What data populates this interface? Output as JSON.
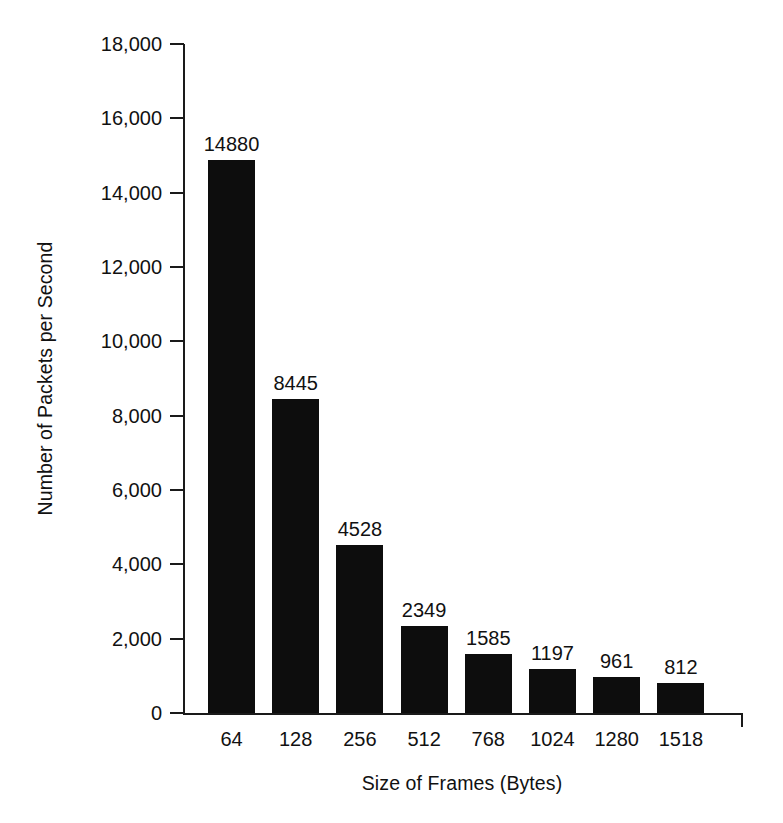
{
  "chart_data": {
    "type": "bar",
    "title": "",
    "subtitle": "",
    "xlabel": "Size of Frames (Bytes)",
    "ylabel": "Number of Packets per Second",
    "categories": [
      "64",
      "128",
      "256",
      "512",
      "768",
      "1024",
      "1280",
      "1518"
    ],
    "values": [
      14880,
      8445,
      4528,
      2349,
      1585,
      1197,
      961,
      812
    ],
    "value_labels": [
      "14880",
      "8445",
      "4528",
      "2349",
      "1585",
      "1197",
      "961",
      "812"
    ],
    "ylim": [
      0,
      18000
    ],
    "ytick_values": [
      18000,
      16000,
      14000,
      12000,
      10000,
      8000,
      6000,
      4000,
      2000,
      0
    ],
    "ytick_labels": [
      "18,000",
      "16,000",
      "14,000",
      "12,000",
      "10,000",
      "8,000",
      "6,000",
      "4,000",
      "2,000",
      "0"
    ],
    "grid": false,
    "legend": null,
    "legend_position": "none",
    "bar_color": "#0d0d0d",
    "axis_color": "#1a1a1a",
    "background_color": "#ffffff",
    "annotations": []
  }
}
